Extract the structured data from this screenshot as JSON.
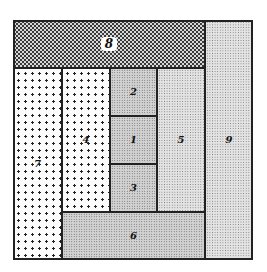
{
  "figure": {
    "type": "squared-rectangle dissection",
    "outer": {
      "left": 13,
      "top": 20,
      "right": 253,
      "bottom": 260
    },
    "tiles": [
      {
        "label": "8",
        "x": 13,
        "y": 20,
        "w": 192,
        "h": 48,
        "texture": "checker-dark",
        "badge": true
      },
      {
        "label": "9",
        "x": 205,
        "y": 20,
        "w": 48,
        "h": 240,
        "texture": "stipple-light"
      },
      {
        "label": "7",
        "x": 13,
        "y": 68,
        "w": 49,
        "h": 192,
        "texture": "coarse-dots"
      },
      {
        "label": "4",
        "x": 62,
        "y": 68,
        "w": 48,
        "h": 144,
        "texture": "coarse-dots"
      },
      {
        "label": "2",
        "x": 110,
        "y": 68,
        "w": 47,
        "h": 48,
        "texture": "stipple-fine"
      },
      {
        "label": "1",
        "x": 110,
        "y": 116,
        "w": 47,
        "h": 48,
        "texture": "stipple-fine"
      },
      {
        "label": "3",
        "x": 110,
        "y": 164,
        "w": 47,
        "h": 48,
        "texture": "stipple-fine"
      },
      {
        "label": "5",
        "x": 157,
        "y": 68,
        "w": 48,
        "h": 144,
        "texture": "stipple-light"
      },
      {
        "label": "6",
        "x": 62,
        "y": 212,
        "w": 143,
        "h": 48,
        "texture": "stipple-fine"
      }
    ]
  }
}
